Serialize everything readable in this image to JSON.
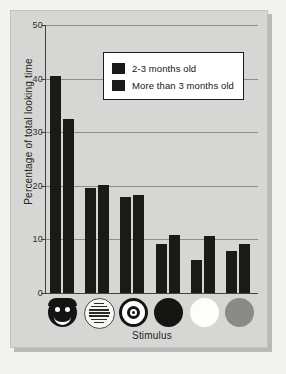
{
  "chart_data": {
    "type": "bar",
    "title": "",
    "xlabel": "Stimulus",
    "ylabel": "Percentage of total looking time",
    "ylim": [
      0,
      50
    ],
    "yticks": [
      0,
      10,
      20,
      30,
      40,
      50
    ],
    "grid": true,
    "legend_position": "top-center",
    "categories": [
      "face",
      "newsprint",
      "bullseye",
      "black circle",
      "white circle",
      "gray circle"
    ],
    "series": [
      {
        "name": "2-3 months old",
        "color": "#1a1a18",
        "values": [
          40.5,
          19.5,
          18.0,
          9.2,
          6.2,
          7.8
        ]
      },
      {
        "name": "More than 3 months old",
        "color": "#1a1a18",
        "values": [
          32.5,
          20.1,
          18.2,
          10.8,
          10.7,
          9.2
        ]
      }
    ]
  },
  "legend": {
    "entries": [
      {
        "label": "2-3 months old"
      },
      {
        "label": "More than 3 months old"
      }
    ]
  },
  "axis": {
    "y_title": "Percentage of total looking time",
    "x_title": "Stimulus",
    "y_tick_labels": [
      "50",
      "40",
      "30",
      "20",
      "10",
      "0"
    ]
  },
  "stimuli": [
    {
      "name": "face-stimulus-icon",
      "kind": "face"
    },
    {
      "name": "newsprint-stimulus-icon",
      "kind": "newsprint"
    },
    {
      "name": "bullseye-stimulus-icon",
      "kind": "bullseye"
    },
    {
      "name": "black-circle-stimulus-icon",
      "kind": "black"
    },
    {
      "name": "white-circle-stimulus-icon",
      "kind": "white"
    },
    {
      "name": "gray-circle-stimulus-icon",
      "kind": "gray"
    }
  ]
}
